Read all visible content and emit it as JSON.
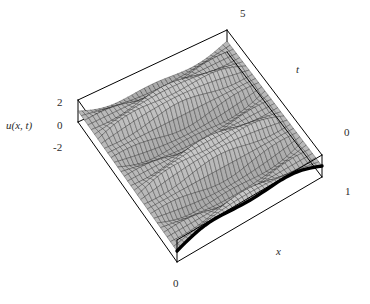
{
  "chart_data": {
    "type": "line",
    "render": "surface3d",
    "title": "",
    "xlabel": "x",
    "ylabel": "t",
    "zlabel": "u(x, t)",
    "xlim": [
      0,
      1
    ],
    "ylim": [
      0,
      5
    ],
    "zlim": [
      -2,
      2
    ],
    "grid": false,
    "legend": false,
    "surface_color": "#b8b8b8",
    "mesh_color": "#1a1a1a",
    "frame_color": "#000000",
    "highlight_color": "#000000",
    "x_ticks": [
      {
        "value": 0,
        "label": "0"
      },
      {
        "value": 1,
        "label": "1"
      }
    ],
    "y_ticks": [
      {
        "value": 0,
        "label": "0"
      },
      {
        "value": 5,
        "label": "5"
      }
    ],
    "z_ticks": [
      {
        "value": 2,
        "label": "2"
      },
      {
        "value": 0,
        "label": "0"
      },
      {
        "value": -2,
        "label": "-2"
      }
    ],
    "surface_formula": "u = 2*sin(pi*x)*cos(pi*t) + 0.55*sin(3*pi*x)*cos(3*pi*t)",
    "mesh_nx": 36,
    "mesh_nt": 30,
    "highlight_edge": "t=0",
    "samples": {
      "x": [
        0,
        0.1,
        0.2,
        0.3,
        0.4,
        0.5,
        0.6,
        0.7,
        0.8,
        0.9,
        1.0
      ],
      "t": [
        0,
        0.5,
        1.0,
        1.5,
        2.0,
        2.5,
        3.0,
        3.5,
        4.0,
        4.5,
        5.0
      ],
      "u_at_t0": [
        0,
        1.07,
        1.73,
        1.07,
        1.79,
        1.45,
        1.79,
        1.07,
        1.73,
        1.07,
        0
      ],
      "u_at_t1": [
        0,
        -1.07,
        -1.73,
        -1.07,
        -1.79,
        -1.45,
        -1.79,
        -1.07,
        -1.73,
        -1.07,
        0
      ],
      "u_at_t2": [
        0,
        1.07,
        1.73,
        1.07,
        1.79,
        1.45,
        1.79,
        1.07,
        1.73,
        1.07,
        0
      ],
      "u_at_t_half": [
        0,
        0.44,
        -0.38,
        0.44,
        -0.29,
        0.55,
        -0.29,
        0.44,
        -0.38,
        0.44,
        0
      ]
    }
  },
  "labels": {
    "z_axis": "u(x, t)",
    "x_axis": "x",
    "t_axis": "t",
    "tick_z_top": "2",
    "tick_z_mid": "0",
    "tick_z_bot": "-2",
    "tick_t_max": "5",
    "tick_t_min": "0",
    "tick_x_max": "1",
    "tick_x_min": "0"
  }
}
